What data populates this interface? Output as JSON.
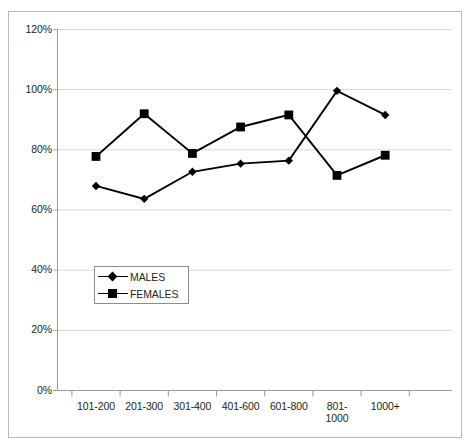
{
  "chart_data": {
    "type": "line",
    "title": "",
    "subtitle": "",
    "xlabel": "",
    "ylabel": "",
    "categories": [
      "101-200",
      "201-300",
      "301-400",
      "401-600",
      "601-800",
      "801-1000",
      "1000+"
    ],
    "category_labels_wrapped": [
      [
        "101-200"
      ],
      [
        "201-300"
      ],
      [
        "301-400"
      ],
      [
        "401-600"
      ],
      [
        "601-800"
      ],
      [
        "801-",
        "1000"
      ],
      [
        "1000+"
      ]
    ],
    "series": [
      {
        "name": "MALES",
        "marker": "diamond",
        "color": "#000000",
        "values": [
          68,
          63.7,
          72.7,
          75.4,
          76.4,
          99.6,
          91.6
        ]
      },
      {
        "name": "FEMALES",
        "marker": "square",
        "color": "#000000",
        "values": [
          77.8,
          92,
          78.8,
          87.6,
          91.6,
          71.5,
          78.2
        ]
      }
    ],
    "ylim": [
      0,
      120
    ],
    "ytick_values": [
      0,
      20,
      40,
      60,
      80,
      100,
      120
    ],
    "ytick_labels": [
      "0%",
      "20%",
      "40%",
      "60%",
      "80%",
      "100%",
      "120%"
    ],
    "grid": {
      "horizontal": true,
      "vertical": false,
      "color": "#d8d8d8"
    },
    "legend": {
      "position": "inside-lower-left",
      "entries": [
        {
          "label": "MALES",
          "marker": "diamond"
        },
        {
          "label": "FEMALES",
          "marker": "square"
        }
      ]
    },
    "axis": {
      "line_color": "#9a9a9a",
      "tick_color": "#9a9a9a"
    },
    "border": {
      "color": "#b9b9b9"
    }
  }
}
